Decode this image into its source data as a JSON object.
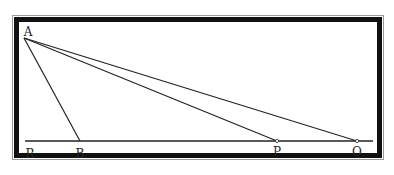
{
  "diagram": {
    "points": {
      "A": {
        "label": "A",
        "x": 24,
        "y": 38,
        "lx": 28,
        "ly": 36
      },
      "R": {
        "label": "R",
        "x": 25,
        "y": 141,
        "lx": 30,
        "ly": 158
      },
      "B": {
        "label": "B",
        "x": 80,
        "y": 141,
        "lx": 80,
        "ly": 158
      },
      "P": {
        "label": "P",
        "x": 277,
        "y": 141,
        "lx": 277,
        "ly": 156
      },
      "Q": {
        "label": "Q",
        "x": 357,
        "y": 141,
        "lx": 357,
        "ly": 156
      }
    },
    "baseline": {
      "x1": 25,
      "x2": 373,
      "y": 141
    },
    "segments": [
      [
        "A",
        "B"
      ],
      [
        "A",
        "P"
      ],
      [
        "A",
        "Q"
      ]
    ],
    "colors": {
      "line": "#222222",
      "frame": "#111111",
      "frame_outer": "#9a9a9a"
    }
  }
}
